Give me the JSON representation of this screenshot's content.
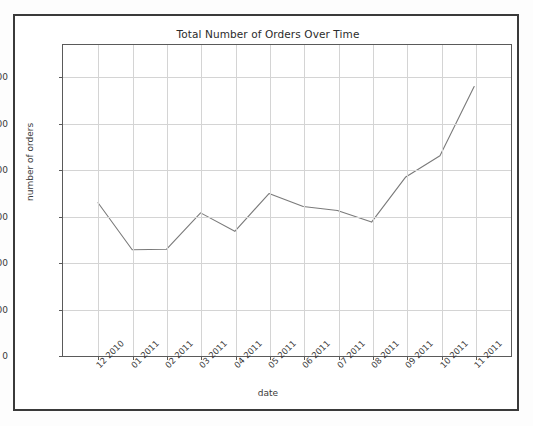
{
  "figure": {
    "title": "Total Number of Orders Over Time",
    "background_color": "#ffffff",
    "frame_color": "#3a3a3a",
    "line_color": "#7a7a7a",
    "grid_color": "#d4d4d4"
  },
  "chart_data": {
    "type": "line",
    "title": "Total Number of Orders Over Time",
    "xlabel": "date",
    "ylabel": "number of orders",
    "categories": [
      "12 2010",
      "01 2011",
      "02 2011",
      "03 2011",
      "04 2011",
      "05 2011",
      "06 2011",
      "07 2011",
      "08 2011",
      "09 2011",
      "10 2011",
      "11 2011"
    ],
    "values": [
      1640,
      1130,
      1135,
      1530,
      1330,
      1740,
      1600,
      1555,
      1430,
      1920,
      2150,
      2900
    ],
    "series": [
      {
        "name": "number of orders",
        "values": [
          1640,
          1130,
          1135,
          1530,
          1330,
          1740,
          1600,
          1555,
          1430,
          1920,
          2150,
          2900
        ]
      }
    ],
    "ylim": [
      0,
      3350
    ],
    "yticks": [
      0,
      500,
      1000,
      1500,
      2000,
      2500,
      3000
    ],
    "ytick_labels": [
      "0",
      "500",
      "1000",
      "1500",
      "2000",
      "2500",
      "3000"
    ],
    "xtick_labels": [
      "12 2010",
      "01 2011",
      "02 2011",
      "03 2011",
      "04 2011",
      "05 2011",
      "06 2011",
      "07 2011",
      "08 2011",
      "09 2011",
      "10 2011",
      "11 2011"
    ],
    "xtick_rotation": -45,
    "grid": true,
    "legend": null,
    "markers": false,
    "line_color": "#7a7a7a",
    "line_width": 1
  }
}
